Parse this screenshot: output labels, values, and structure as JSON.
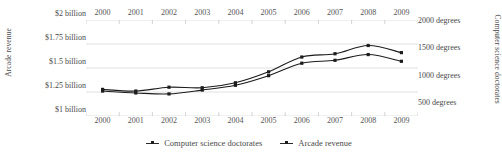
{
  "chart_data": {
    "type": "line",
    "title": "",
    "x": [
      2000,
      2001,
      2002,
      2003,
      2004,
      2005,
      2006,
      2007,
      2008,
      2009
    ],
    "x_tick_labels": [
      "2000",
      "2001",
      "2002",
      "2003",
      "2004",
      "2005",
      "2006",
      "2007",
      "2008",
      "2009"
    ],
    "xlabel": "",
    "grid": true,
    "legend_position": "bottom-center",
    "axes": {
      "left": {
        "label": "Arcade revenue",
        "tick_labels": [
          "$2 billion",
          "$1.75 billion",
          "$1.5 billion",
          "$1.25 billion",
          "$1 billion"
        ],
        "tick_values": [
          2.0,
          1.75,
          1.5,
          1.25,
          1.0
        ],
        "ylim": [
          1.0,
          2.0
        ],
        "unit": "billion USD"
      },
      "right": {
        "label": "Computer science doctorates",
        "tick_labels": [
          "2000 degrees",
          "1500 degrees",
          "1000 degrees",
          "500 degrees"
        ],
        "tick_values": [
          2000,
          1500,
          1000,
          500
        ],
        "ylim": [
          375,
          2125
        ],
        "unit": "degrees"
      }
    },
    "series": [
      {
        "name": "Computer science doctorates",
        "axis": "right",
        "color": "#1c1c1c",
        "values": [
          860,
          830,
          900,
          890,
          980,
          1180,
          1450,
          1510,
          1660,
          1530
        ]
      },
      {
        "name": "Arcade revenue",
        "axis": "left",
        "color": "#1c1c1c",
        "values": [
          1.26,
          1.24,
          1.23,
          1.27,
          1.32,
          1.42,
          1.55,
          1.58,
          1.64,
          1.57
        ]
      }
    ]
  },
  "legend": {
    "items": [
      {
        "label": "Computer science doctorates"
      },
      {
        "label": "Arcade revenue"
      }
    ]
  }
}
